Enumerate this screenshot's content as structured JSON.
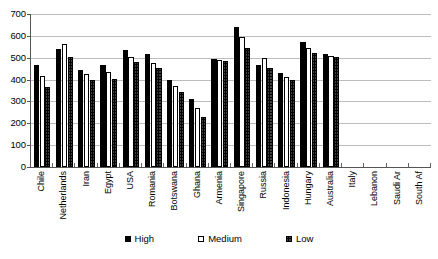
{
  "chart_data": {
    "type": "bar",
    "title": "",
    "subtitle": "",
    "xlabel": "",
    "ylabel": "",
    "ylim": [
      0,
      700
    ],
    "ytick_step": 100,
    "yticks": [
      "0",
      "100",
      "200",
      "300",
      "400",
      "500",
      "600",
      "700"
    ],
    "grid": true,
    "legend_position": "bottom",
    "categories": [
      "Chile",
      "Netherlands",
      "Iran",
      "Egypt",
      "USA",
      "Romania",
      "Botswana",
      "Ghana",
      "Armenia",
      "Singapore",
      "Russia",
      "Indonesia",
      "Hungary",
      "Australia",
      "Italy",
      "Lebanon",
      "Saudi Ar",
      "South Af"
    ],
    "series": [
      {
        "name": "High",
        "fill": "solid-black",
        "values": [
          468,
          540,
          445,
          468,
          537,
          517,
          400,
          310,
          492,
          640,
          468,
          430,
          570,
          518,
          null,
          null,
          null,
          null
        ]
      },
      {
        "name": "Medium",
        "fill": "white",
        "values": [
          415,
          562,
          425,
          435,
          502,
          478,
          370,
          272,
          488,
          595,
          500,
          410,
          545,
          510,
          null,
          null,
          null,
          null
        ]
      },
      {
        "name": "Low",
        "fill": "dotted-pattern",
        "values": [
          365,
          505,
          398,
          402,
          480,
          455,
          345,
          230,
          485,
          545,
          455,
          398,
          520,
          505,
          null,
          null,
          null,
          null
        ]
      }
    ]
  },
  "legend": {
    "items": [
      {
        "label": "High",
        "swatch": "solid-black-square-icon"
      },
      {
        "label": "Medium",
        "swatch": "white-square-icon"
      },
      {
        "label": "Low",
        "swatch": "dotted-square-icon"
      }
    ]
  },
  "colors": {
    "high": "#000000",
    "medium": "#ffffff",
    "low": "#ffffff",
    "axis": "#555555",
    "gridline": "#bdbdbd",
    "background": "#ffffff"
  }
}
